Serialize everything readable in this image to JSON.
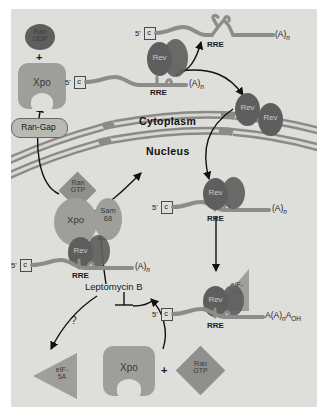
{
  "figure": {
    "background_color": "#dededa",
    "compartments": {
      "cytoplasm_label": "Cytoplasm",
      "nucleus_label": "Nucleus"
    },
    "colors": {
      "panel_bg": "#dededa",
      "rev_dark": "#5e5e5e",
      "xpo_gray": "#9e9e9a",
      "ran_gray": "#8f8f8b",
      "rna_gray": "#8c8c88",
      "membrane_gray": "#8a8a86",
      "text": "#1a1a1a"
    },
    "nodes": {
      "ran_gdp": "Ran GDP",
      "ran_gdp_line1": "Ran",
      "ran_gdp_line2": "GDP",
      "plus_1": "+",
      "plus_2": "+",
      "xpo_top": "Xpo",
      "xpo_complex": "Xpo",
      "xpo_bottom": "Xpo",
      "ran_gap": "Ran-Gap",
      "ran_gtp_line1": "Ran",
      "ran_gtp_line2": "GTP",
      "ran_gtp_bottom_line1": "Ran",
      "ran_gtp_bottom_line2": "GTP",
      "sam68_line1": "Sam",
      "sam68_line2": "68",
      "rev": "Rev",
      "eif5a_line1": "eIF-",
      "eif5a_line2": "5A",
      "leptomycin": "Leptomycin B",
      "question_mark": "?"
    },
    "rna": {
      "cap_letter": "c",
      "five_prime": "5'",
      "rre": "RRE",
      "poly_a": "(A)",
      "poly_a_sub": "n",
      "poly_a_oh_pre": "A(A)",
      "poly_a_oh_sub": "n",
      "poly_a_oh_post": "A",
      "poly_a_oh_sub2": "OH"
    },
    "transcripts": [
      {
        "id": "unspliced-top-right",
        "cap": "c",
        "five_prime": "5'",
        "structure": "RRE",
        "tail": "(A)n",
        "has_stem_loop": true,
        "rev_bound": false
      },
      {
        "id": "rev-bound-top-left",
        "cap": "c",
        "five_prime": "5'",
        "structure": "RRE",
        "tail": "(A)n",
        "rev_bound": true
      },
      {
        "id": "nuclear-rre-right",
        "cap": "c",
        "five_prime": "5'",
        "structure": "RRE",
        "tail": "(A)n",
        "rev_bound": true
      },
      {
        "id": "export-complex-left",
        "cap": "c",
        "five_prime": "5'",
        "structure": "RRE",
        "tail": "(A)n",
        "rev_bound": true
      },
      {
        "id": "eif5a-complex-right",
        "cap": "c",
        "five_prime": "5'",
        "structure": "RRE",
        "tail": "A(A)nAOH",
        "rev_bound": true
      }
    ]
  }
}
